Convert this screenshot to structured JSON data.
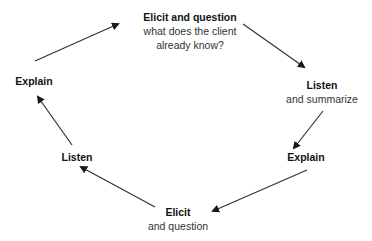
{
  "diagram": {
    "type": "cycle",
    "nodes": [
      {
        "id": "n1",
        "title": "Elicit and question",
        "sub": [
          "what does the client",
          "already know?"
        ]
      },
      {
        "id": "n2",
        "title": "Listen",
        "sub": [
          "and summarize"
        ]
      },
      {
        "id": "n3",
        "title": "Explain",
        "sub": []
      },
      {
        "id": "n4",
        "title": "Elicit",
        "sub": [
          "and question"
        ]
      },
      {
        "id": "n5",
        "title": "Listen",
        "sub": []
      },
      {
        "id": "n6",
        "title": "Explain",
        "sub": []
      }
    ],
    "edges": [
      {
        "from": "n1",
        "to": "n2"
      },
      {
        "from": "n2",
        "to": "n3"
      },
      {
        "from": "n3",
        "to": "n4"
      },
      {
        "from": "n4",
        "to": "n5"
      },
      {
        "from": "n5",
        "to": "n6"
      },
      {
        "from": "n6",
        "to": "n1"
      }
    ],
    "colors": {
      "line": "#222222",
      "text": "#1a1a1a"
    }
  }
}
